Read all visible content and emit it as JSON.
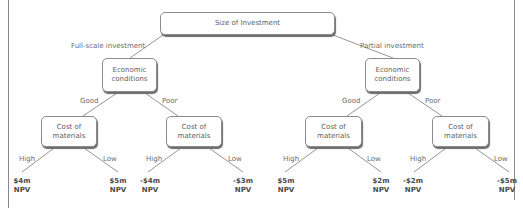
{
  "root": {
    "label": "Size of Investment"
  },
  "branches": [
    {
      "label": "Full-scale investment",
      "node": {
        "label_line1": "Economic",
        "label_line2": "conditions"
      },
      "sub": [
        {
          "label": "Good",
          "node": {
            "label_line1": "Cost of",
            "label_line2": "materials"
          },
          "leaves": [
            {
              "edge": "High",
              "value": "$4m",
              "unit": "NPV"
            },
            {
              "edge": "Low",
              "value": "$5m",
              "unit": "NPV"
            }
          ]
        },
        {
          "label": "Poor",
          "node": {
            "label_line1": "Cost of",
            "label_line2": "materials"
          },
          "leaves": [
            {
              "edge": "High",
              "value": "-$4m",
              "unit": "NPV"
            },
            {
              "edge": "Low",
              "value": "-$3m",
              "unit": "NPV"
            }
          ]
        }
      ]
    },
    {
      "label": "Partial investment",
      "node": {
        "label_line1": "Economic",
        "label_line2": "conditions"
      },
      "sub": [
        {
          "label": "Good",
          "node": {
            "label_line1": "Cost of",
            "label_line2": "materials"
          },
          "leaves": [
            {
              "edge": "High",
              "value": "$5m",
              "unit": "NPV"
            },
            {
              "edge": "Low",
              "value": "$2m",
              "unit": "NPV"
            }
          ]
        },
        {
          "label": "Poor",
          "node": {
            "label_line1": "Cost of",
            "label_line2": "materials"
          },
          "leaves": [
            {
              "edge": "High",
              "value": "-$2m",
              "unit": "NPV"
            },
            {
              "edge": "Low",
              "value": "-$5m",
              "unit": "NPV"
            }
          ]
        }
      ]
    }
  ],
  "colors": {
    "line": "#7a7a7a",
    "border": "#8c8c8c",
    "text": "#5e5e5e"
  }
}
